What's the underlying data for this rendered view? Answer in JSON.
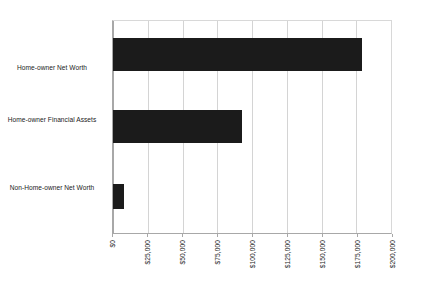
{
  "chart_data": {
    "type": "bar",
    "orientation": "horizontal",
    "title": "",
    "subtitle": "",
    "xlabel": "",
    "ylabel": "",
    "categories": [
      "Home-owner Net Worth",
      "Home-owner Financial Assets",
      "Non-Home-owner Net Worth"
    ],
    "values": [
      179000,
      93000,
      8000
    ],
    "series": [
      {
        "name": "",
        "values": [
          179000,
          93000,
          8000
        ]
      }
    ],
    "xlim": [
      0,
      200000
    ],
    "xtick_values": [
      0,
      25000,
      50000,
      75000,
      100000,
      125000,
      150000,
      175000,
      200000
    ],
    "xtick_labels": [
      "$0",
      "$25,000",
      "$50,000",
      "$75,000",
      "$100,000",
      "$125,000",
      "$150,000",
      "$175,000",
      "$200,000"
    ],
    "xtick_rotation": -90,
    "grid": true,
    "grid_axis": "x",
    "legend": false,
    "legend_position": "none",
    "bar_color": "#1b1b1b",
    "grid_color": "#d4d4d4",
    "axis_color": "#a8a8a8",
    "text_color": "#1a1a1a",
    "background": "#ffffff"
  }
}
